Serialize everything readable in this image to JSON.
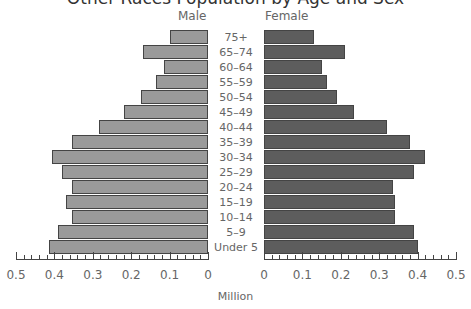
{
  "chart_data": {
    "type": "bar",
    "subtype": "population-pyramid",
    "title": "Other Races Population by Age and Sex",
    "xlabel": "Million",
    "ylabel": "",
    "categories": [
      "75+",
      "65–74",
      "60–64",
      "55–59",
      "50–54",
      "45–49",
      "40–44",
      "35–39",
      "30–34",
      "25–29",
      "20–24",
      "15–19",
      "10–14",
      "5–9",
      "Under 5"
    ],
    "series": [
      {
        "name": "Male",
        "color": "#9a9a9a",
        "values": [
          0.1,
          0.17,
          0.115,
          0.135,
          0.175,
          0.22,
          0.285,
          0.355,
          0.405,
          0.38,
          0.355,
          0.37,
          0.355,
          0.39,
          0.415
        ]
      },
      {
        "name": "Female",
        "color": "#5d5d5d",
        "values": [
          0.13,
          0.21,
          0.15,
          0.165,
          0.19,
          0.235,
          0.32,
          0.38,
          0.42,
          0.39,
          0.335,
          0.34,
          0.34,
          0.39,
          0.4
        ]
      }
    ],
    "xlim": [
      0,
      0.5
    ],
    "male_ticks": [
      "0.5",
      "0.4",
      "0.3",
      "0.2",
      "0.1",
      "0"
    ],
    "female_ticks": [
      "0",
      "0.1",
      "0.2",
      "0.3",
      "0.4",
      "0.5"
    ],
    "grid": false,
    "legend_position": "top (side labels)"
  },
  "labels": {
    "male": "Male",
    "female": "Female",
    "xlabel": "Million",
    "title": "Other Races Population by Age and Sex"
  }
}
